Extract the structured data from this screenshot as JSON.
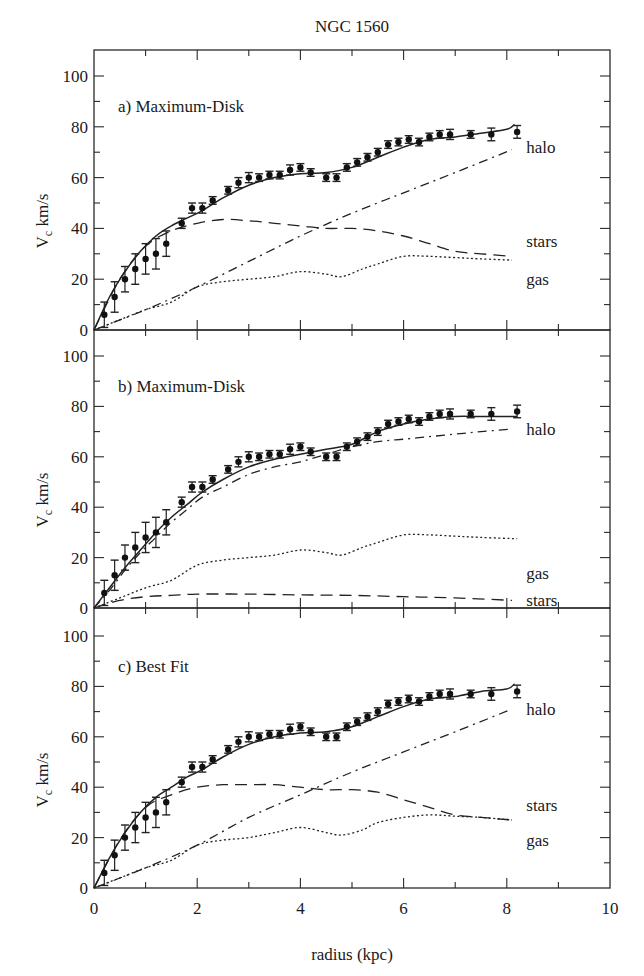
{
  "figure": {
    "title": "NGC 1560",
    "xlabel": "radius (kpc)",
    "ylabel_main": "V",
    "ylabel_sub": "c",
    "ylabel_unit": " km/s",
    "xticks": [
      0,
      2,
      4,
      6,
      8,
      10
    ],
    "yticks": [
      0,
      20,
      40,
      60,
      80,
      100
    ]
  },
  "chart_data": [
    {
      "type": "line",
      "title": "a) Maximum-Disk",
      "xlabel": "radius (kpc)",
      "ylabel": "Vc km/s",
      "xlim": [
        0,
        10
      ],
      "ylim": [
        0,
        105
      ],
      "observed": {
        "r": [
          0.2,
          0.4,
          0.6,
          0.8,
          1.0,
          1.2,
          1.4,
          1.7,
          1.9,
          2.1,
          2.3,
          2.6,
          2.8,
          3.0,
          3.2,
          3.4,
          3.6,
          3.8,
          4.0,
          4.2,
          4.5,
          4.7,
          4.9,
          5.1,
          5.3,
          5.5,
          5.7,
          5.9,
          6.1,
          6.3,
          6.5,
          6.7,
          6.9,
          7.3,
          7.7,
          8.2
        ],
        "v": [
          6,
          13,
          20,
          24,
          28,
          30,
          34,
          42,
          48,
          48,
          51,
          55,
          58,
          60,
          60,
          61,
          61,
          63,
          64,
          62,
          60,
          60,
          64,
          66,
          68,
          70,
          73,
          74,
          75,
          74,
          76,
          77,
          77,
          77,
          77,
          78
        ],
        "err": [
          5,
          6,
          5,
          6,
          6,
          6,
          5,
          2,
          2,
          2,
          1.5,
          1.5,
          2,
          2,
          1.5,
          1.5,
          1.5,
          2,
          1.5,
          1.5,
          1.5,
          1.5,
          1.5,
          1.5,
          1.5,
          1.5,
          1.5,
          1.5,
          1.5,
          1.5,
          1.5,
          1.5,
          2,
          1.5,
          2.5,
          2.5
        ]
      },
      "series": [
        {
          "name": "total",
          "style": "solid",
          "r": [
            0,
            0.3,
            0.6,
            0.9,
            1.2,
            1.5,
            1.8,
            2.1,
            2.5,
            3.0,
            3.5,
            4.0,
            4.5,
            5.0,
            5.5,
            6.0,
            6.5,
            7.0,
            7.5,
            8.0,
            8.15
          ],
          "v": [
            0,
            13,
            23,
            31,
            37,
            41,
            44,
            47,
            52,
            57,
            60,
            61.5,
            62,
            64,
            68,
            72,
            75,
            76,
            77.5,
            79,
            81
          ]
        },
        {
          "name": "halo",
          "style": "dashdot",
          "r": [
            0,
            1,
            2,
            3,
            4,
            5,
            6,
            7,
            8.1
          ],
          "v": [
            0,
            8,
            17,
            27,
            37,
            46,
            54,
            62,
            71
          ]
        },
        {
          "name": "stars",
          "style": "dashed",
          "r": [
            0,
            0.5,
            1.0,
            1.5,
            2.0,
            2.5,
            3.0,
            3.5,
            4.0,
            4.5,
            5.0,
            5.5,
            6.0,
            6.5,
            7.0,
            7.5,
            8.1
          ],
          "v": [
            0,
            20,
            33,
            39,
            42,
            43.5,
            43,
            42,
            41,
            40,
            40,
            39,
            37,
            34,
            31,
            30,
            29
          ]
        },
        {
          "name": "gas",
          "style": "dotted",
          "r": [
            0,
            0.5,
            1.0,
            1.5,
            2.0,
            2.5,
            3.0,
            3.5,
            4.0,
            4.5,
            4.8,
            5.2,
            5.5,
            6.0,
            6.5,
            7.0,
            7.5,
            8.1
          ],
          "v": [
            0,
            4,
            8,
            11,
            17,
            19,
            20,
            21,
            23,
            22,
            21,
            24,
            26,
            29,
            29,
            28.5,
            28,
            27.5
          ]
        }
      ],
      "labels": [
        {
          "text": "halo",
          "r": 8.3,
          "v": 72
        },
        {
          "text": "stars",
          "r": 8.3,
          "v": 35
        },
        {
          "text": "gas",
          "r": 8.3,
          "v": 20
        }
      ]
    },
    {
      "type": "line",
      "title": "b) Maximum-Disk",
      "xlabel": "radius (kpc)",
      "ylabel": "Vc km/s",
      "xlim": [
        0,
        10
      ],
      "ylim": [
        0,
        105
      ],
      "observed": {
        "r": [
          0.2,
          0.4,
          0.6,
          0.8,
          1.0,
          1.2,
          1.4,
          1.7,
          1.9,
          2.1,
          2.3,
          2.6,
          2.8,
          3.0,
          3.2,
          3.4,
          3.6,
          3.8,
          4.0,
          4.2,
          4.5,
          4.7,
          4.9,
          5.1,
          5.3,
          5.5,
          5.7,
          5.9,
          6.1,
          6.3,
          6.5,
          6.7,
          6.9,
          7.3,
          7.7,
          8.2
        ],
        "v": [
          6,
          13,
          20,
          24,
          28,
          30,
          34,
          42,
          48,
          48,
          51,
          55,
          58,
          60,
          60,
          61,
          61,
          63,
          64,
          62,
          60,
          60,
          64,
          66,
          68,
          70,
          73,
          74,
          75,
          74,
          76,
          77,
          77,
          77,
          77,
          78
        ],
        "err": [
          5,
          6,
          5,
          6,
          6,
          6,
          5,
          2,
          2,
          2,
          1.5,
          1.5,
          2,
          2,
          1.5,
          1.5,
          1.5,
          2,
          1.5,
          1.5,
          1.5,
          1.5,
          1.5,
          1.5,
          1.5,
          1.5,
          1.5,
          1.5,
          1.5,
          1.5,
          1.5,
          1.5,
          2,
          1.5,
          2.5,
          2.5
        ]
      },
      "series": [
        {
          "name": "total",
          "style": "solid",
          "r": [
            0,
            0.3,
            0.6,
            0.9,
            1.2,
            1.5,
            1.8,
            2.1,
            2.5,
            3.0,
            3.5,
            4.0,
            4.5,
            5.0,
            5.5,
            6.0,
            6.5,
            7.0,
            7.5,
            8.2
          ],
          "v": [
            0,
            8,
            16,
            23,
            30,
            36,
            41,
            46,
            51,
            56,
            59,
            61,
            63,
            65,
            70,
            73,
            75,
            76,
            76,
            76
          ]
        },
        {
          "name": "halo",
          "style": "dashdot",
          "r": [
            0,
            0.3,
            0.6,
            0.9,
            1.2,
            1.5,
            1.8,
            2.1,
            2.5,
            3.0,
            3.5,
            4.0,
            4.5,
            5.0,
            5.5,
            6.0,
            6.5,
            7.0,
            7.5,
            8.1
          ],
          "v": [
            0,
            7,
            15,
            22,
            28,
            34,
            39,
            44,
            48,
            53,
            56,
            58,
            61,
            64,
            66,
            67,
            68,
            69,
            70,
            71
          ]
        },
        {
          "name": "gas",
          "style": "dotted",
          "r": [
            0,
            0.5,
            1.0,
            1.5,
            2.0,
            2.5,
            3.0,
            3.5,
            4.0,
            4.5,
            4.8,
            5.2,
            5.5,
            6.0,
            6.5,
            7.0,
            7.5,
            8.2
          ],
          "v": [
            0,
            4,
            8,
            11,
            17,
            19,
            20,
            21,
            23,
            22,
            21,
            24,
            26,
            29,
            29,
            28.5,
            28,
            27.5
          ]
        },
        {
          "name": "stars",
          "style": "dashed",
          "r": [
            0,
            0.5,
            1.0,
            1.5,
            2.0,
            3.0,
            4.0,
            5.0,
            6.0,
            7.0,
            8.1
          ],
          "v": [
            0,
            3,
            4.5,
            5,
            5.5,
            5.5,
            5.2,
            5,
            4.5,
            4,
            3
          ]
        }
      ],
      "labels": [
        {
          "text": "halo",
          "r": 8.3,
          "v": 71
        },
        {
          "text": "gas",
          "r": 8.3,
          "v": 14
        },
        {
          "text": "stars",
          "r": 8.3,
          "v": 3
        }
      ]
    },
    {
      "type": "line",
      "title": "c) Best Fit",
      "xlabel": "radius (kpc)",
      "ylabel": "Vc km/s",
      "xlim": [
        0,
        10
      ],
      "ylim": [
        0,
        105
      ],
      "observed": {
        "r": [
          0.2,
          0.4,
          0.6,
          0.8,
          1.0,
          1.2,
          1.4,
          1.7,
          1.9,
          2.1,
          2.3,
          2.6,
          2.8,
          3.0,
          3.2,
          3.4,
          3.6,
          3.8,
          4.0,
          4.2,
          4.5,
          4.7,
          4.9,
          5.1,
          5.3,
          5.5,
          5.7,
          5.9,
          6.1,
          6.3,
          6.5,
          6.7,
          6.9,
          7.3,
          7.7,
          8.2
        ],
        "v": [
          6,
          13,
          20,
          24,
          28,
          30,
          34,
          42,
          48,
          48,
          51,
          55,
          58,
          60,
          60,
          61,
          61,
          63,
          64,
          62,
          60,
          60,
          64,
          66,
          68,
          70,
          73,
          74,
          75,
          74,
          76,
          77,
          77,
          77,
          77,
          78
        ],
        "err": [
          5,
          6,
          5,
          6,
          6,
          6,
          5,
          2,
          2,
          2,
          1.5,
          1.5,
          2,
          2,
          1.5,
          1.5,
          1.5,
          2,
          1.5,
          1.5,
          1.5,
          1.5,
          1.5,
          1.5,
          1.5,
          1.5,
          1.5,
          1.5,
          1.5,
          1.5,
          1.5,
          1.5,
          2,
          1.5,
          2.5,
          2.5
        ]
      },
      "series": [
        {
          "name": "total",
          "style": "solid",
          "r": [
            0,
            0.3,
            0.6,
            0.9,
            1.2,
            1.5,
            1.8,
            2.1,
            2.5,
            3.0,
            3.5,
            4.0,
            4.5,
            5.0,
            5.5,
            6.0,
            6.5,
            7.0,
            7.5,
            8.0,
            8.15
          ],
          "v": [
            0,
            12,
            22,
            30,
            36,
            40,
            44,
            47,
            52,
            57,
            60,
            61.5,
            62,
            64,
            68,
            72,
            75,
            76,
            78,
            79,
            81
          ]
        },
        {
          "name": "halo",
          "style": "dashdot",
          "r": [
            0,
            1,
            2,
            3,
            4,
            5,
            6,
            7,
            8.1
          ],
          "v": [
            0,
            8,
            17,
            28,
            37,
            46,
            54,
            62,
            71
          ]
        },
        {
          "name": "stars",
          "style": "dashed",
          "r": [
            0,
            0.5,
            1.0,
            1.5,
            2.0,
            2.5,
            3.0,
            3.5,
            4.0,
            4.5,
            5.0,
            5.5,
            6.0,
            6.5,
            7.0,
            7.5,
            8.1
          ],
          "v": [
            0,
            19,
            32,
            37,
            40,
            41,
            41,
            41,
            40,
            39,
            39,
            38,
            35,
            32,
            29,
            28,
            27
          ]
        },
        {
          "name": "gas",
          "style": "dotted",
          "r": [
            0,
            0.5,
            1.0,
            1.5,
            2.0,
            2.5,
            3.0,
            3.5,
            4.0,
            4.5,
            4.8,
            5.2,
            5.5,
            6.0,
            6.5,
            7.0,
            7.5,
            8.1
          ],
          "v": [
            0,
            4,
            8,
            11,
            17,
            19,
            20,
            22,
            24,
            22,
            21,
            23,
            26,
            28,
            29,
            28.5,
            28,
            27
          ]
        }
      ],
      "labels": [
        {
          "text": "halo",
          "r": 8.3,
          "v": 71
        },
        {
          "text": "stars",
          "r": 8.3,
          "v": 33
        },
        {
          "text": "gas",
          "r": 8.3,
          "v": 19
        }
      ]
    }
  ]
}
